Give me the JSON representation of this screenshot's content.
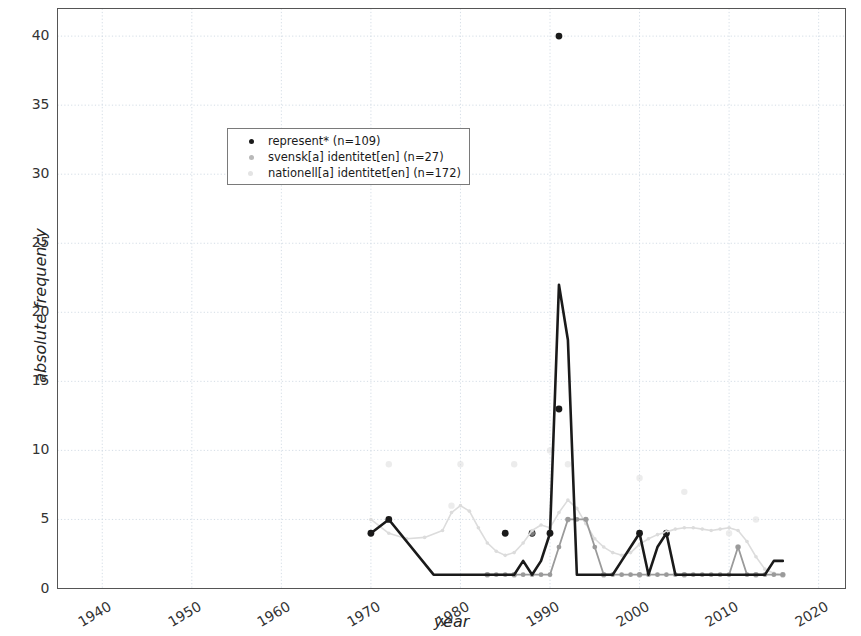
{
  "axes": {
    "xlabel": "year",
    "ylabel": "absolute frequency",
    "xticks": [
      "1940",
      "1950",
      "1960",
      "1970",
      "1980",
      "1990",
      "2000",
      "2010",
      "2020"
    ],
    "yticks": [
      "0",
      "5",
      "10",
      "15",
      "20",
      "25",
      "30",
      "35",
      "40"
    ]
  },
  "legend": {
    "items": [
      {
        "label": "represent* (n=109)",
        "color": "#1a1a1a"
      },
      {
        "label": "svensk[a] identitet[en] (n=27)",
        "color": "#9a9a9a"
      },
      {
        "label": "nationell[a] identitet[en] (n=172)",
        "color": "#dcdcdc"
      }
    ]
  },
  "chart_data": {
    "type": "line",
    "title": "",
    "xlabel": "year",
    "ylabel": "absolute frequency",
    "xlim": [
      1935,
      2023
    ],
    "ylim": [
      0,
      42
    ],
    "xticks": [
      1940,
      1950,
      1960,
      1970,
      1980,
      1990,
      2000,
      2010,
      2020
    ],
    "yticks": [
      0,
      5,
      10,
      15,
      20,
      25,
      30,
      35,
      40
    ],
    "grid": true,
    "legend_position": "upper left",
    "series": [
      {
        "name": "represent* (n=109)",
        "color": "#1a1a1a",
        "x": [
          1970,
          1972,
          1977,
          1983,
          1984,
          1985,
          1986,
          1987,
          1988,
          1989,
          1990,
          1991,
          1992,
          1993,
          1994,
          1995,
          1996,
          1997,
          1998,
          1999,
          2000,
          2001,
          2002,
          2003,
          2004,
          2005,
          2006,
          2007,
          2008,
          2009,
          2010,
          2011,
          2012,
          2013,
          2014,
          2015,
          2016
        ],
        "y": [
          4,
          5,
          1,
          1,
          1,
          1,
          1,
          2,
          1,
          2,
          4,
          22,
          18,
          1,
          1,
          1,
          1,
          1,
          2,
          3,
          4,
          1,
          3,
          4,
          1,
          1,
          1,
          1,
          1,
          1,
          1,
          1,
          1,
          1,
          1,
          2,
          2
        ]
      },
      {
        "name": "svensk[a] identitet[en] (n=27)",
        "color": "#9a9a9a",
        "x": [
          1983,
          1984,
          1985,
          1986,
          1987,
          1988,
          1989,
          1990,
          1991,
          1992,
          1993,
          1994,
          1995,
          1996,
          1997,
          1998,
          1999,
          2000,
          2001,
          2002,
          2003,
          2004,
          2005,
          2006,
          2007,
          2008,
          2009,
          2010,
          2011,
          2012,
          2013,
          2014,
          2015,
          2016
        ],
        "y": [
          1,
          1,
          1,
          1,
          1,
          1,
          1,
          1,
          3,
          5,
          5,
          5,
          3,
          1,
          1,
          1,
          1,
          1,
          1,
          1,
          1,
          1,
          1,
          1,
          1,
          1,
          1,
          1,
          3,
          1,
          1,
          1,
          1,
          1
        ]
      },
      {
        "name": "nationell[a] identitet[en] (n=172)",
        "color": "#dcdcdc",
        "x": [
          1970,
          1972,
          1974,
          1976,
          1978,
          1979,
          1980,
          1981,
          1982,
          1983,
          1984,
          1985,
          1986,
          1987,
          1988,
          1989,
          1990,
          1991,
          1992,
          1993,
          1994,
          1995,
          1996,
          1997,
          1998,
          1999,
          2000,
          2001,
          2002,
          2003,
          2004,
          2005,
          2006,
          2007,
          2008,
          2009,
          2010,
          2011,
          2012,
          2013,
          2014,
          2015,
          2016
        ],
        "y": [
          5,
          4,
          3.6,
          3.7,
          4.2,
          5.5,
          6,
          5.6,
          4.4,
          3.3,
          2.7,
          2.4,
          2.6,
          3.3,
          4.2,
          4.6,
          4.4,
          5.5,
          6.4,
          5.8,
          4.7,
          3.6,
          3,
          2.6,
          2.4,
          2.6,
          3.2,
          3.6,
          3.9,
          4.1,
          4.3,
          4.4,
          4.4,
          4.3,
          4.2,
          4.3,
          4.4,
          4.2,
          3.4,
          2.3,
          1.4,
          1.1,
          1
        ]
      }
    ],
    "scatter": [
      {
        "series": "represent* (n=109)",
        "color": "#1a1a1a",
        "x": [
          1970,
          1972,
          1985,
          1988,
          1990,
          1991,
          1991,
          2000,
          2003
        ],
        "y": [
          4,
          5,
          4,
          4,
          4,
          40,
          13,
          4,
          4
        ]
      },
      {
        "series": "svensk[a] identitet[en] (n=27)",
        "color": "#9a9a9a",
        "x": [
          1983,
          1986,
          1988,
          1992,
          1994,
          1996,
          2000,
          2005,
          2011,
          2013,
          2016
        ],
        "y": [
          1,
          1,
          4,
          5,
          5,
          1,
          1,
          1,
          3,
          1,
          1
        ]
      },
      {
        "series": "nationell[a] identitet[en] (n=172)",
        "color": "#dcdcdc",
        "x": [
          1972,
          1979,
          1980,
          1986,
          1990,
          1992,
          2000,
          2005,
          2010,
          2013
        ],
        "y": [
          9,
          6,
          9,
          9,
          10,
          9,
          8,
          7,
          4,
          5
        ]
      }
    ]
  }
}
